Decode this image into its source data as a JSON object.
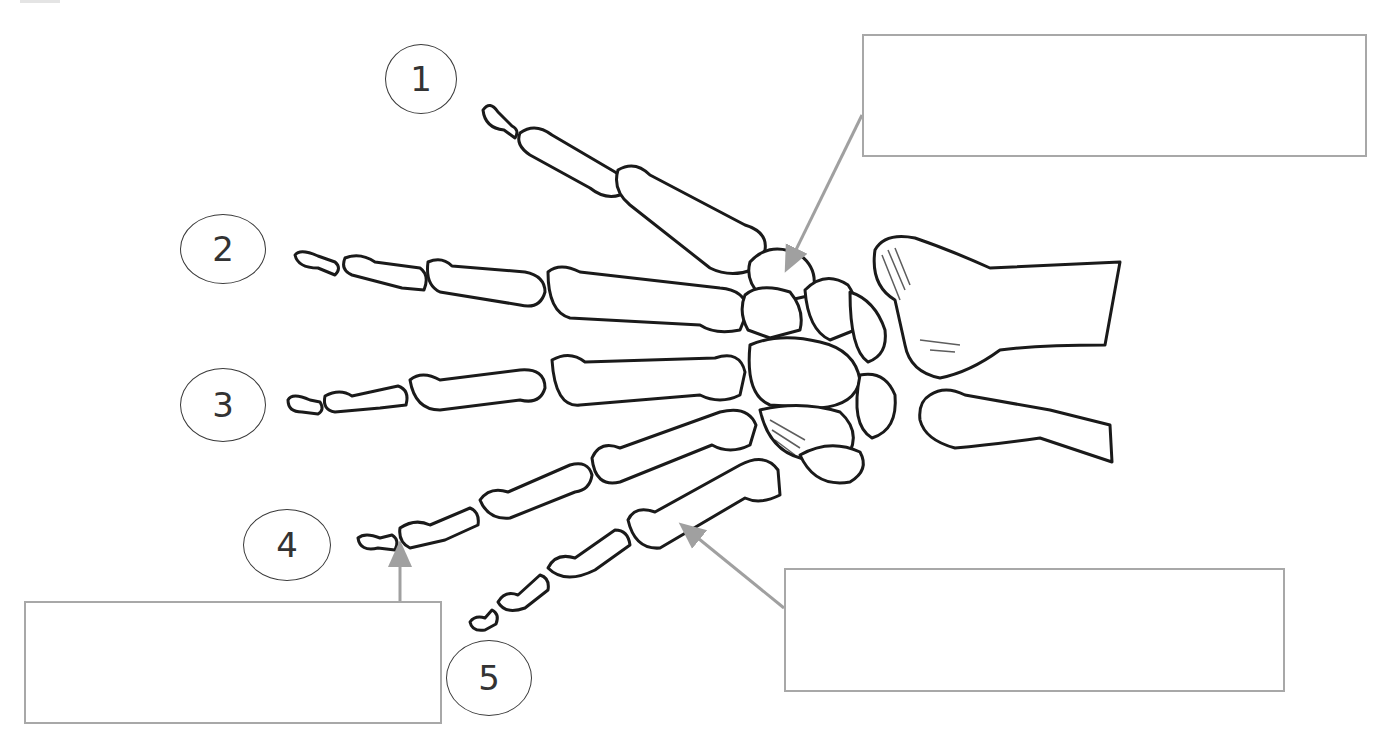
{
  "diagram": {
    "title": "",
    "finger_labels": [
      {
        "number": "1",
        "cx": 420,
        "cy": 80
      },
      {
        "number": "2",
        "cx": 222,
        "cy": 249
      },
      {
        "number": "3",
        "cx": 222,
        "cy": 404
      },
      {
        "number": "4",
        "cx": 272,
        "cy": 545
      },
      {
        "number": "5",
        "cx": 490,
        "cy": 677
      }
    ],
    "answer_boxes": [
      {
        "id": "carpal-label",
        "text": "",
        "x": 862,
        "y": 34,
        "w": 505,
        "h": 123,
        "arrow_target": "carpals"
      },
      {
        "id": "phalanx-label",
        "text": "",
        "x": 24,
        "y": 601,
        "w": 418,
        "h": 123,
        "arrow_target": "distal-phalanx-finger-4"
      },
      {
        "id": "metacarpal-label",
        "text": "",
        "x": 784,
        "y": 568,
        "w": 501,
        "h": 124,
        "arrow_target": "metacarpal-finger-5"
      }
    ],
    "colors": {
      "box_border": "#a8a8a8",
      "arrow": "#a0a0a0",
      "bone_outline": "#1a1a1a",
      "circle_border": "#3a3a3a",
      "background": "#ffffff"
    }
  }
}
